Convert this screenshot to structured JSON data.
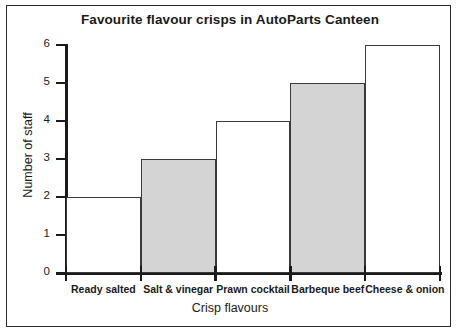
{
  "chart_data": {
    "type": "bar",
    "title": "Favourite flavour crisps in AutoParts Canteen",
    "xlabel": "Crisp flavours",
    "ylabel": "Number of staff",
    "categories": [
      "Ready salted",
      "Salt & vinegar",
      "Prawn cocktail",
      "Barbeque beef",
      "Cheese & onion"
    ],
    "values": [
      2,
      3,
      4,
      5,
      6
    ],
    "bar_fills": [
      "#ffffff",
      "#d4d4d4",
      "#ffffff",
      "#d4d4d4",
      "#ffffff"
    ],
    "bar_edge_color": "#3a3a3a",
    "ylim": [
      0,
      6
    ],
    "yticks": [
      0,
      1,
      2,
      3,
      4,
      5,
      6
    ],
    "ytick_labels": [
      "0",
      "1",
      "2",
      "3",
      "4",
      "5",
      "6"
    ],
    "grid": false,
    "legend": false,
    "axis_color": "#1a1a1a",
    "background": "#ffffff"
  }
}
